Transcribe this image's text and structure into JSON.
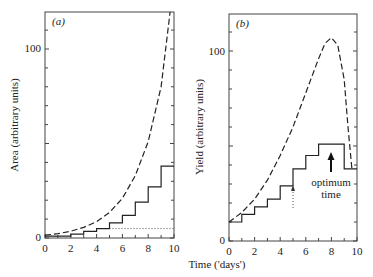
{
  "chart_data": [
    {
      "panel": "(a)",
      "type": "line",
      "title": "",
      "panel_label": "(a)",
      "xlabel": "Time ('days')",
      "ylabel": "Area (arbitrary units)",
      "xlim": [
        0,
        10
      ],
      "ylim": [
        0,
        120
      ],
      "x_ticks": [
        0,
        2,
        4,
        6,
        8,
        10
      ],
      "x_minor_ticks": [
        1,
        3,
        5,
        7,
        9
      ],
      "y_tick_labels": [
        "0",
        "100"
      ],
      "y_minor_tick_step": 10,
      "grid": false,
      "series": [
        {
          "name": "potential growth (dashed)",
          "style": "dashed",
          "x": [
            0,
            1,
            2,
            3,
            4,
            5,
            6,
            7,
            8,
            9,
            9.7
          ],
          "values": [
            1.5,
            2.3,
            3.6,
            5.6,
            8.7,
            13.5,
            21,
            33,
            51,
            80,
            120
          ]
        },
        {
          "name": "actual area (staircase)",
          "style": "step",
          "x": [
            0,
            1,
            2,
            3,
            4,
            5,
            6,
            7,
            8,
            9,
            10
          ],
          "values": [
            1,
            1,
            2,
            3.5,
            5,
            8,
            12,
            19,
            27,
            38,
            38
          ]
        },
        {
          "name": "reference level (dotted)",
          "style": "dotted",
          "x": [
            5,
            10
          ],
          "values": [
            5,
            5
          ]
        }
      ]
    },
    {
      "panel": "(b)",
      "type": "line",
      "title": "",
      "panel_label": "(b)",
      "xlabel": "Time ('days')",
      "ylabel": "Yield (arbitrary units)",
      "xlim": [
        0,
        10
      ],
      "ylim": [
        0,
        120
      ],
      "x_ticks": [
        0,
        2,
        4,
        6,
        8,
        10
      ],
      "x_minor_ticks": [
        1,
        3,
        5,
        7,
        9
      ],
      "y_tick_labels": [
        "0",
        "100"
      ],
      "y_minor_tick_step": 10,
      "grid": false,
      "series": [
        {
          "name": "potential yield (dashed)",
          "style": "dashed",
          "x": [
            0,
            1,
            2,
            3,
            4,
            5,
            6,
            7,
            7.5,
            8,
            8.5,
            9,
            9.3,
            9.6
          ],
          "values": [
            10,
            15,
            22,
            32,
            45,
            60,
            78,
            96,
            104,
            107,
            103,
            85,
            60,
            38
          ]
        },
        {
          "name": "actual yield (staircase)",
          "style": "step",
          "x": [
            0,
            1,
            2,
            3,
            4,
            5,
            6,
            7,
            8,
            9,
            10
          ],
          "values": [
            10,
            14,
            18,
            22,
            29,
            38,
            45,
            51,
            51,
            38,
            38
          ]
        }
      ],
      "annotations": [
        {
          "text": "optimum time",
          "x": 8,
          "y": 30,
          "arrow": "solid up arrow at t=8 pointing to staircase maximum"
        },
        {
          "text": "",
          "x": 5,
          "y": 22,
          "arrow": "dotted up arrow at t=5"
        }
      ]
    }
  ],
  "labels": {
    "panel_a": "(a)",
    "panel_b": "(b)",
    "ylabel_a": "Area (arbitrary units)",
    "ylabel_b": "Yield (arbitrary units)",
    "xlabel": "Time ('days')",
    "annotation_line1": "optimum",
    "annotation_line2": "time",
    "ytick_100": "100",
    "ytick_0": "0",
    "xticks": [
      "0",
      "2",
      "4",
      "6",
      "8",
      "10"
    ]
  }
}
